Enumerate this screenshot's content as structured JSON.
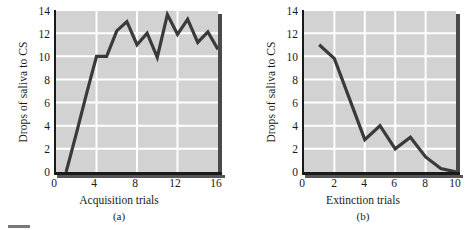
{
  "figure": {
    "footer_rule": ""
  },
  "panels": [
    {
      "id": "a",
      "caption": "(a)",
      "xlabel": "Acquisition trials",
      "ylabel": "Drops of saliva to CS",
      "yticks": [
        "0",
        "2",
        "4",
        "6",
        "8",
        "10",
        "12",
        "14"
      ],
      "xticks": [
        "0",
        "4",
        "8",
        "12",
        "16"
      ]
    },
    {
      "id": "b",
      "caption": "(b)",
      "xlabel": "Extinction trials",
      "ylabel": "Drops of saliva to CS",
      "yticks": [
        "0",
        "2",
        "4",
        "6",
        "8",
        "10",
        "12",
        "14"
      ],
      "xticks": [
        "0",
        "2",
        "4",
        "6",
        "8",
        "10"
      ]
    }
  ],
  "colors": {
    "plot_background": "#d2d2d2",
    "gridline": "#ffffff",
    "series_line": "#3a3a3a",
    "axis": "#1a1a1a",
    "shadow": "#4a4a4a",
    "page_background": "#ffffff"
  },
  "chart_data": [
    {
      "type": "line",
      "title": "",
      "subtitle": "(a)",
      "xlabel": "Acquisition trials",
      "ylabel": "Drops of saliva to CS",
      "xlim": [
        0,
        16
      ],
      "ylim": [
        0,
        14
      ],
      "xticks": [
        0,
        4,
        8,
        12,
        16
      ],
      "yticks": [
        0,
        2,
        4,
        6,
        8,
        10,
        12,
        14
      ],
      "grid": true,
      "gridlines_x": [
        4,
        8,
        12
      ],
      "gridlines_y": [
        2,
        4,
        6,
        8,
        10,
        12,
        14
      ],
      "legend": null,
      "x": [
        1,
        2,
        3,
        4,
        5,
        6,
        7,
        8,
        9,
        10,
        11,
        12,
        13,
        14,
        15,
        16
      ],
      "values": [
        0.0,
        3.3,
        6.7,
        10.0,
        10.0,
        12.2,
        13.0,
        11.0,
        12.0,
        9.9,
        13.6,
        11.9,
        13.2,
        11.2,
        12.1,
        10.6
      ],
      "series": [
        {
          "name": "Drops of saliva to CS",
          "values": [
            0.0,
            3.3,
            6.7,
            10.0,
            10.0,
            12.2,
            13.0,
            11.0,
            12.0,
            9.9,
            13.6,
            11.9,
            13.2,
            11.2,
            12.1,
            10.6
          ]
        }
      ]
    },
    {
      "type": "line",
      "title": "",
      "subtitle": "(b)",
      "xlabel": "Extinction trials",
      "ylabel": "Drops of saliva to CS",
      "xlim": [
        0,
        10
      ],
      "ylim": [
        0,
        14
      ],
      "xticks": [
        0,
        2,
        4,
        6,
        8,
        10
      ],
      "yticks": [
        0,
        2,
        4,
        6,
        8,
        10,
        12,
        14
      ],
      "grid": true,
      "gridlines_x": [
        2,
        4,
        6,
        8
      ],
      "gridlines_y": [
        2,
        4,
        6,
        8,
        10,
        12,
        14
      ],
      "legend": null,
      "x": [
        1,
        2,
        3,
        4,
        5,
        6,
        7,
        8,
        9,
        10
      ],
      "values": [
        11.0,
        9.8,
        6.3,
        2.8,
        4.0,
        2.0,
        3.0,
        1.3,
        0.3,
        0.0
      ],
      "series": [
        {
          "name": "Drops of saliva to CS",
          "values": [
            11.0,
            9.8,
            6.3,
            2.8,
            4.0,
            2.0,
            3.0,
            1.3,
            0.3,
            0.0
          ]
        }
      ]
    }
  ]
}
